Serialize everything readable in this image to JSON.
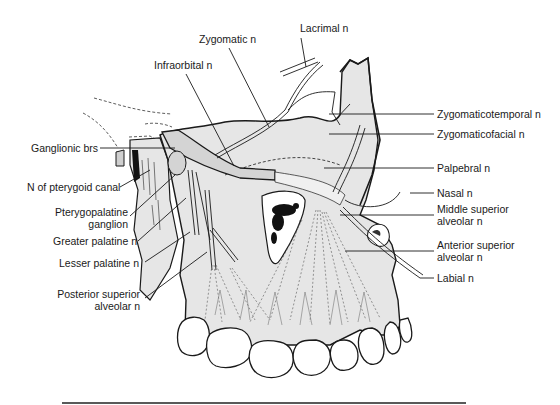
{
  "figure": {
    "colors": {
      "ink": "#1a1a1a",
      "bone_fill": "#e6e6e6",
      "nerve_fill": "#d4d4d4",
      "background": "#ffffff"
    }
  },
  "labels": {
    "lacrimal": "Lacrimal n",
    "zygomatic": "Zygomatic n",
    "infraorbital": "Infraorbital n",
    "zygomaticotemporal": "Zygomaticotemporal n",
    "zygomaticofacial": "Zygomaticofacial n",
    "ganglionic": "Ganglionic brs",
    "palpebral": "Palpebral n",
    "pterygoid_canal": "N of pterygoid canal",
    "nasal": "Nasal n",
    "middle_superior_alveolar": [
      "Middle superior",
      "alveolar n"
    ],
    "pterygopalatine_ganglion": [
      "Pterygopalatine",
      "ganglion"
    ],
    "anterior_superior_alveolar": [
      "Anterior superior",
      "alveolar n"
    ],
    "greater_palatine": "Greater palatine n",
    "labial": "Labial n",
    "lesser_palatine": "Lesser palatine n",
    "posterior_superior_alveolar": [
      "Posterior superior",
      "alveolar n"
    ]
  }
}
